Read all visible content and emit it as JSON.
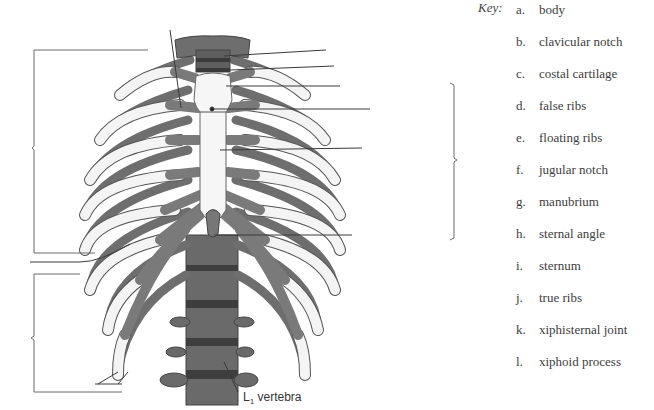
{
  "key": {
    "title": "Key:",
    "items": [
      {
        "letter": "a.",
        "label": "body",
        "top": 2
      },
      {
        "letter": "b.",
        "label": "clavicular notch",
        "top": 34
      },
      {
        "letter": "c.",
        "label": "costal cartilage",
        "top": 66
      },
      {
        "letter": "d.",
        "label": "false ribs",
        "top": 98
      },
      {
        "letter": "e.",
        "label": "floating ribs",
        "top": 130
      },
      {
        "letter": "f.",
        "label": "jugular notch",
        "top": 162
      },
      {
        "letter": "g.",
        "label": "manubrium",
        "top": 194
      },
      {
        "letter": "h.",
        "label": "sternal angle",
        "top": 226
      },
      {
        "letter": "i.",
        "label": "sternum",
        "top": 258
      },
      {
        "letter": "j.",
        "label": "true ribs",
        "top": 290
      },
      {
        "letter": "k.",
        "label": "xiphisternal joint",
        "top": 322
      },
      {
        "letter": "l.",
        "label": "xiphoid process",
        "top": 354
      }
    ]
  },
  "figure": {
    "vertebra_label_main": "L",
    "vertebra_label_sub": "1",
    "vertebra_label_rest": " vertebra",
    "colors": {
      "bone": "#f4f4f4",
      "bone_outline": "#555555",
      "posterior_rib": "#6e6e6e",
      "cartilage": "#7a7a7a",
      "vertebra": "#6a6a6a",
      "leader_line": "#3a3a3a",
      "bracket": "#6a6a6a"
    }
  }
}
